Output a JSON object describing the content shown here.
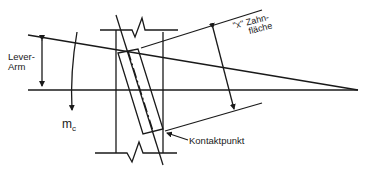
{
  "diagram": {
    "type": "technical-gear-tooth-contact",
    "labels": {
      "lever_arm_line1": "Lever-",
      "lever_arm_line2": "Arm",
      "moment_main": "m",
      "moment_sub": "c",
      "tooth_face_line1": "\"x\" Zahn-",
      "tooth_face_line2": "fläche",
      "contact_point": "Kontaktpunkt"
    },
    "colors": {
      "line": "#1a1a1a",
      "background": "#ffffff"
    }
  }
}
